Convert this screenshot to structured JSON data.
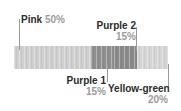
{
  "chart_data": {
    "type": "bar",
    "subtype": "stacked-horizontal-100",
    "title": "",
    "xlabel": "",
    "ylabel": "",
    "grid": false,
    "legend_position": "callout-labels",
    "orientation": "horizontal",
    "total": 100,
    "units": "%",
    "categories": [
      "Pink",
      "Purple 1",
      "Purple 2",
      "Yellow-green"
    ],
    "values": [
      50,
      15,
      15,
      20
    ],
    "series": [
      {
        "name": "Composition",
        "values": [
          50,
          15,
          15,
          20
        ]
      }
    ],
    "segments": [
      {
        "label": "Pink",
        "value": 50,
        "value_text": "50%",
        "color": "#cfcfcf"
      },
      {
        "label": "Purple 1",
        "value": 15,
        "value_text": "15%",
        "color": "#8f8f8f"
      },
      {
        "label": "Purple 2",
        "value": 15,
        "value_text": "15%",
        "color": "#8a8a8a"
      },
      {
        "label": "Yellow-green",
        "value": 20,
        "value_text": "20%",
        "color": "#d5d5d5"
      }
    ]
  },
  "callouts": {
    "pink": {
      "name": "Pink",
      "pct": "50%"
    },
    "purple1": {
      "name": "Purple 1",
      "pct": "15%"
    },
    "purple2": {
      "name": "Purple 2",
      "pct": "15%"
    },
    "yellowgreen": {
      "name": "Yellow-green",
      "pct": "20%"
    }
  },
  "colors": {
    "background": "#ffffff",
    "segment_pink": "#cfcfcf",
    "segment_purple1": "#8f8f8f",
    "segment_purple2": "#8a8a8a",
    "segment_yellowgreen": "#d5d5d5",
    "label_name": "#2b2b2b",
    "label_percent": "#9b9b9b",
    "leader_line": "#9a9a9a"
  }
}
